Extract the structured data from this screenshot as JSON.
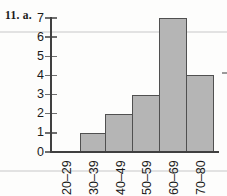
{
  "figure": {
    "label": "11. a.",
    "background": "#fdfdfc"
  },
  "chart_data": {
    "type": "bar",
    "title": "11. a.",
    "categories": [
      "20–29",
      "30–39",
      "40–49",
      "50–59",
      "60–69",
      "70–80"
    ],
    "values": [
      0,
      1,
      2,
      3,
      7,
      4
    ],
    "xlabel": "",
    "ylabel": "",
    "ylim": [
      0,
      7
    ],
    "yticks": [
      0,
      1,
      2,
      3,
      4,
      5,
      6,
      7
    ],
    "grid": false,
    "legend_position": "none",
    "x_tick_label_rotation_deg": -90,
    "colors": {
      "bar_fill": "#b5b5b5",
      "bar_border": "#505050",
      "axis": "#404040",
      "text": "#1a1a1a",
      "rule_line": "#e2e2e2",
      "background": "#fdfdfc"
    }
  }
}
